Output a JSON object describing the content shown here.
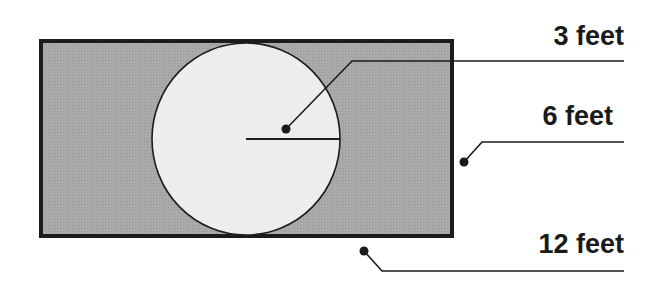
{
  "diagram": {
    "type": "geometry-figure",
    "labels": {
      "radius": "3 feet",
      "width": "6 feet",
      "length": "12 feet"
    },
    "colors": {
      "rectangle_fill": "#a6a6a6",
      "circle_fill": "#ececec",
      "stroke": "#1a1a1a",
      "background": "#ffffff"
    },
    "shapes": {
      "rectangle": {
        "x": 41,
        "y": 41,
        "width": 411,
        "height": 195
      },
      "circle": {
        "cx": 246,
        "cy": 139,
        "r": 94
      },
      "radius_line": {
        "x1": 246,
        "y1": 139,
        "x2": 340,
        "y2": 139
      }
    }
  }
}
